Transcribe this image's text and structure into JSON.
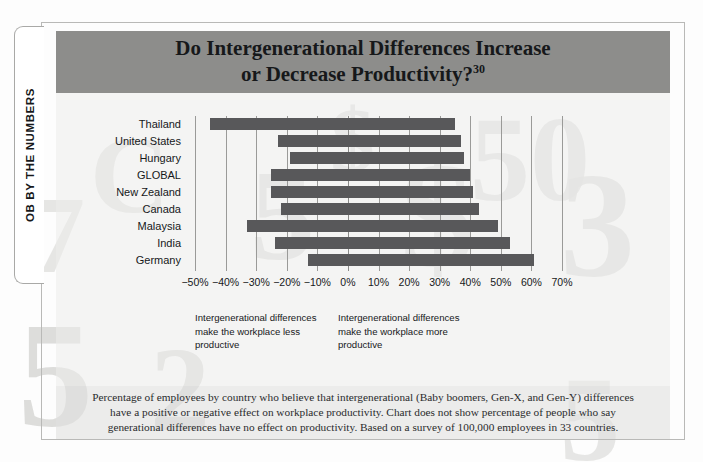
{
  "sidebar_tab": {
    "label": "OB BY THE NUMBERS"
  },
  "title": {
    "line1": "Do Intergenerational Differences Increase",
    "line2": "or Decrease Productivity?",
    "note_ref": "30"
  },
  "annotations": {
    "left": "Intergenerational differences make the workplace less productive",
    "right": "Intergenerational differences make the workplace more productive"
  },
  "caption": "Percentage of employees by country who believe that intergenerational (Baby boomers, Gen-X, and Gen-Y) differences have a positive or negative effect on workplace productivity. Chart does not show percentage of people who say generational differences have no effect on productivity. Based on a survey of 100,000 employees in 33 countries.",
  "colors": {
    "bar": "#58585a",
    "title_band": "#8d8d8b",
    "gridline": "#9a9a98",
    "text": "#16181a",
    "plate": "#ededeb"
  },
  "chart_data": {
    "type": "bar",
    "orientation": "horizontal-diverging",
    "title": "Do Intergenerational Differences Increase or Decrease Productivity?",
    "xlabel": "",
    "ylabel": "",
    "xlim": [
      -50,
      70
    ],
    "xtick_values": [
      -50,
      -40,
      -30,
      -20,
      -10,
      0,
      10,
      20,
      30,
      40,
      50,
      60,
      70
    ],
    "xtick_labels": [
      "−50%",
      "−40%",
      "−30%",
      "−20%",
      "−10%",
      "0%",
      "10%",
      "20%",
      "30%",
      "40%",
      "50%",
      "60%",
      "70%"
    ],
    "grid": true,
    "legend": false,
    "categories": [
      "Thailand",
      "United States",
      "Hungary",
      "GLOBAL",
      "New Zealand",
      "Canada",
      "Malaysia",
      "India",
      "Germany"
    ],
    "series": [
      {
        "name": "Less productive",
        "values": [
          -45,
          -23,
          -19,
          -25,
          -25,
          -22,
          -33,
          -24,
          -13
        ]
      },
      {
        "name": "More productive",
        "values": [
          35,
          37,
          38,
          40,
          41,
          43,
          49,
          53,
          61
        ]
      }
    ]
  }
}
